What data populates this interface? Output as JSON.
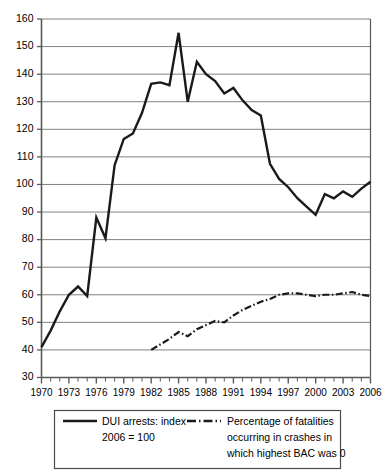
{
  "chart_data": {
    "type": "line",
    "title": "",
    "subtitle": "",
    "xlabel": "",
    "ylabel": "",
    "xlim": [
      1970,
      2006
    ],
    "ylim": [
      30,
      160
    ],
    "ytick_step": 10,
    "grid": true,
    "grid_axis": "y",
    "legend_position": "bottom",
    "x": [
      1970,
      1971,
      1972,
      1973,
      1974,
      1975,
      1976,
      1977,
      1978,
      1979,
      1980,
      1981,
      1982,
      1983,
      1984,
      1985,
      1986,
      1987,
      1988,
      1989,
      1990,
      1991,
      1992,
      1993,
      1994,
      1995,
      1996,
      1997,
      1998,
      1999,
      2000,
      2001,
      2002,
      2003,
      2004,
      2005,
      2006
    ],
    "xticks": [
      1970,
      1973,
      1976,
      1979,
      1982,
      1985,
      1988,
      1991,
      1994,
      1997,
      2000,
      2003,
      2006
    ],
    "xtick_labels": [
      "1970",
      "1973",
      "1976",
      "1979",
      "1982",
      "1985",
      "1988",
      "1991",
      "1994",
      "1997",
      "2000",
      "2003",
      "2006"
    ],
    "yticks": [
      30,
      40,
      50,
      60,
      70,
      80,
      90,
      100,
      110,
      120,
      130,
      140,
      150,
      160
    ],
    "ytick_labels": [
      "30",
      "40",
      "50",
      "60",
      "70",
      "80",
      "90",
      "100",
      "110",
      "120",
      "130",
      "140",
      "150",
      "160"
    ],
    "series": [
      {
        "name": "DUI arrests: index 2006 = 100",
        "legend_label_line1": "DUI arrests: index",
        "legend_label_line2": "2006 = 100",
        "style": "solid",
        "color": "#1a1a1a",
        "width": 2.4,
        "x": [
          1970,
          1971,
          1972,
          1973,
          1974,
          1975,
          1976,
          1977,
          1978,
          1979,
          1980,
          1981,
          1982,
          1983,
          1984,
          1985,
          1986,
          1987,
          1988,
          1989,
          1990,
          1991,
          1992,
          1993,
          1994,
          1995,
          1996,
          1997,
          1998,
          1999,
          2000,
          2001,
          2002,
          2003,
          2004,
          2005,
          2006
        ],
        "values": [
          41,
          47,
          54,
          60,
          63,
          59.5,
          88,
          80.5,
          107,
          116.5,
          118.5,
          126,
          136.5,
          137,
          136,
          155,
          130,
          144.5,
          140,
          137.5,
          133,
          135,
          130.5,
          127,
          125,
          107.5,
          102,
          99,
          95,
          92,
          89,
          96.5,
          95,
          97.5,
          95.5,
          98.5,
          101
        ]
      },
      {
        "name": "Percentage of fatalities occurring in crashes in which highest BAC was 0",
        "legend_label_line1": "Percentage of fatalities",
        "legend_label_line2": "occurring in crashes in",
        "legend_label_line3": "which highest BAC was 0",
        "style": "dash-dot",
        "color": "#1a1a1a",
        "width": 2.2,
        "x": [
          1982,
          1983,
          1984,
          1985,
          1986,
          1987,
          1988,
          1989,
          1990,
          1991,
          1992,
          1993,
          1994,
          1995,
          1996,
          1997,
          1998,
          1999,
          2000,
          2001,
          2002,
          2003,
          2004,
          2005,
          2006
        ],
        "values": [
          40,
          42,
          44,
          46.5,
          45,
          47.5,
          49,
          50.5,
          50,
          52.5,
          54.5,
          56,
          57.5,
          58.5,
          60,
          60.5,
          60.5,
          60,
          59.5,
          60,
          60,
          60.5,
          61,
          60,
          59.5
        ]
      }
    ]
  },
  "axis": {
    "left_tick_labels": [
      "160",
      "150",
      "140",
      "130",
      "120",
      "110",
      "100",
      "90",
      "80",
      "70",
      "60",
      "50",
      "40",
      "30"
    ],
    "bottom_tick_labels": [
      "1970",
      "1973",
      "1976",
      "1979",
      "1982",
      "1985",
      "1988",
      "1991",
      "1994",
      "1997",
      "2000",
      "2003",
      "2006"
    ]
  },
  "legend": {
    "entries": [
      {
        "key": "dui-arrests",
        "sample_style": "solid",
        "lines": [
          "DUI arrests: index",
          "2006 = 100"
        ]
      },
      {
        "key": "pct-fatalities-bac-zero",
        "sample_style": "dash-dot",
        "lines": [
          "Percentage of fatalities",
          "occurring in crashes in",
          "which highest BAC was 0"
        ]
      }
    ]
  },
  "colors": {
    "line": "#1a1a1a",
    "grid": "#808080",
    "axis": "#595959",
    "background": "#ffffff",
    "legend_border": "#4d4d4d"
  }
}
